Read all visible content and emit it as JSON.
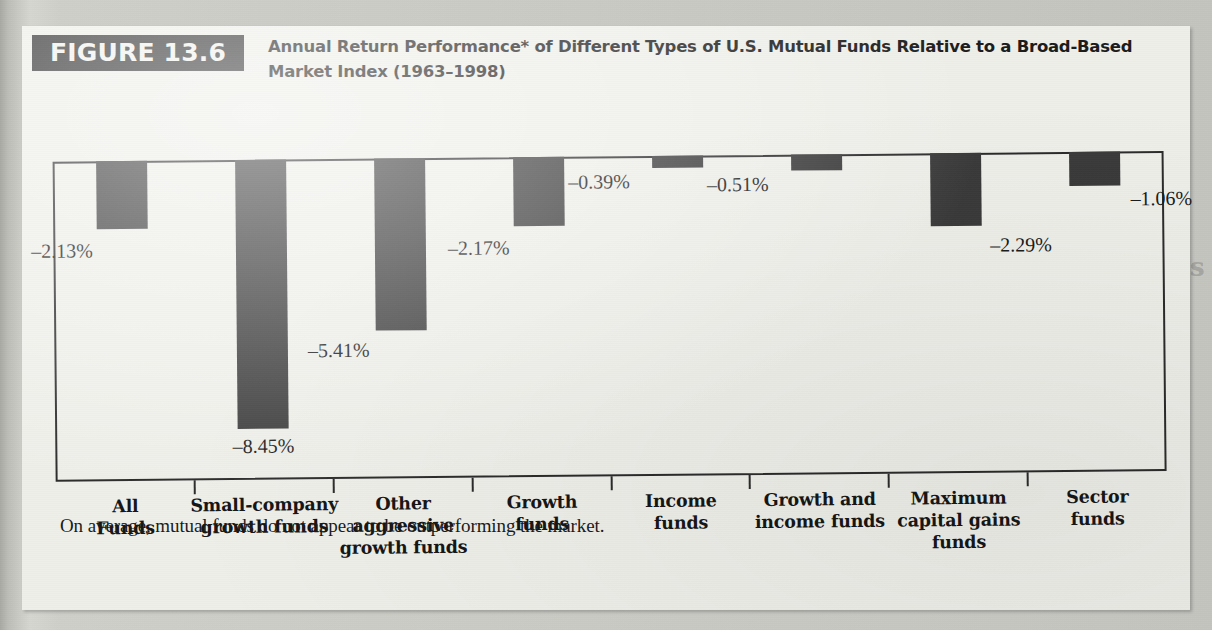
{
  "figure": {
    "badge": "FIGURE 13.6",
    "title": "Annual Return Performance* of Different Types of U.S. Mutual Funds Relative to a Broad-Based Market Index (1963–1998)",
    "footnote": "On average, mutual funds do not appear to be outperforming the market."
  },
  "chart_data": {
    "type": "bar",
    "title": "Annual Return Performance* of Different Types of U.S. Mutual Funds Relative to a Broad-Based Market Index (1963–1998)",
    "xlabel": "",
    "ylabel": "",
    "ylim": [
      -9.6,
      0
    ],
    "grid": false,
    "legend": "none",
    "categories": [
      "All Funds",
      "Small-company growth funds",
      "Other aggressive growth funds",
      "Growth funds",
      "Income funds",
      "Growth and income funds",
      "Maximum capital gains funds",
      "Sector funds"
    ],
    "category_lines": [
      [
        "All",
        "Funds"
      ],
      [
        "Small-company",
        "growth funds"
      ],
      [
        "Other",
        "aggressive",
        "growth funds"
      ],
      [
        "Growth",
        "funds"
      ],
      [
        "Income",
        "funds"
      ],
      [
        "Growth and",
        "income funds"
      ],
      [
        "Maximum",
        "capital gains",
        "funds"
      ],
      [
        "Sector",
        "funds"
      ]
    ],
    "values": [
      -2.13,
      -8.45,
      -5.41,
      -2.17,
      -0.39,
      -0.51,
      -2.29,
      -1.06
    ],
    "data_labels": [
      "–2.13%",
      "–8.45%",
      "–5.41%",
      "–2.17%",
      "–0.39%",
      "–0.51%",
      "–2.29%",
      "–1.06%"
    ],
    "annotations": [
      "On average, mutual funds do not appear to be outperforming the market."
    ],
    "bar_color": "#3a3a3a",
    "axis_color": "#2a2a2a"
  },
  "ghost_text": {
    "line1": "comparison of active and passive",
    "line2": "extent of active  managers  that  are  about  the  same",
    "line3": "annual data that they also tend to be outperformed by the market",
    "heading": "The Regulatory Challenge of Mutual Funds",
    "line4": "the schedule of expenses and  insurance  coverage  which suit",
    "line5": "instruments outright.  In  the  case  of  a  bond  fund  the  rate  of",
    "line6": "these funds have  shown  consistent  value  returns  over  time",
    "line7": "growth of  the  capital  in  the  fund.  The  principal  value  of  the",
    "line8": "shares but is managed by the"
  }
}
